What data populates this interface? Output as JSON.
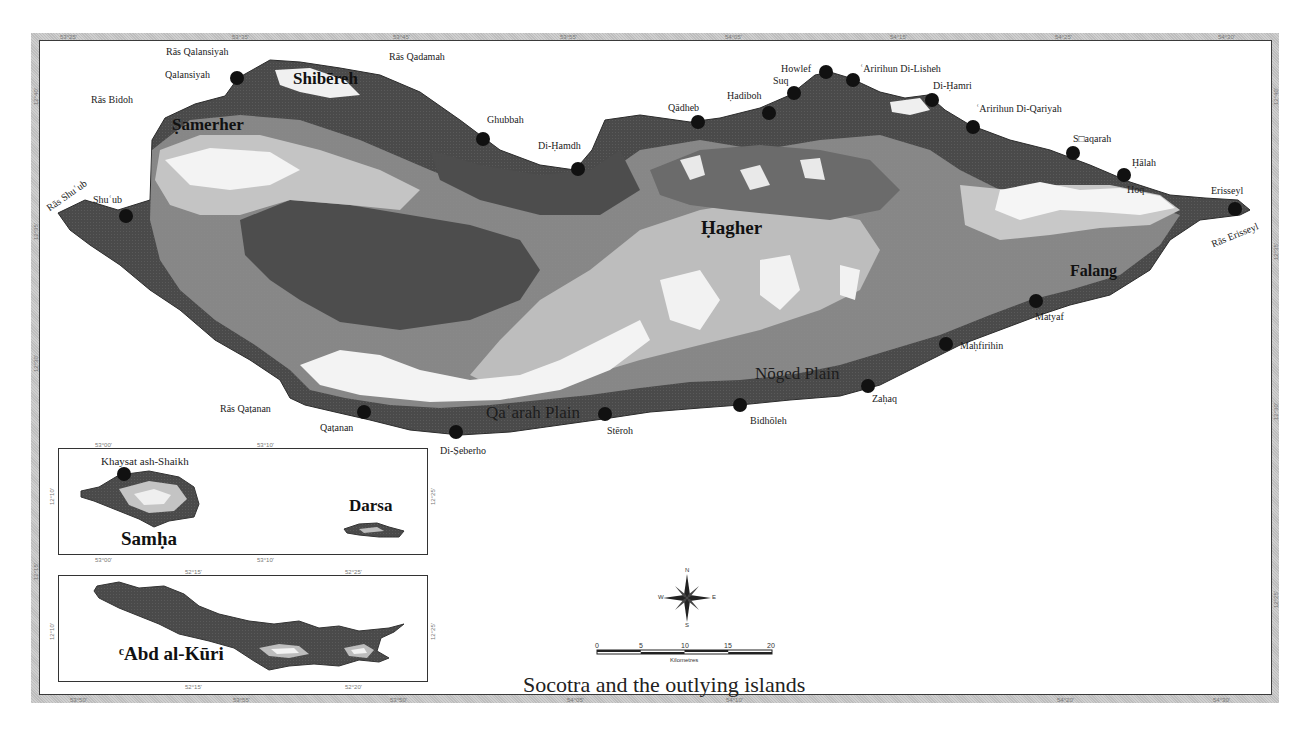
{
  "map": {
    "title": "Socotra and the outlying islands",
    "colors": {
      "sea": "#ffffff",
      "lowland": "#4a4a4a",
      "mid_elevation": "#8e8e8e",
      "high_elevation": "#bdbdbd",
      "summit": "#f2f2f2",
      "frame": "#c6c6c6",
      "settlement_dot": "#111111"
    },
    "frame_ticks": {
      "top": [
        "53°25'",
        "53°35'",
        "53°45'",
        "53°55'",
        "54°05'",
        "54°15'",
        "54°25'",
        "54°30'"
      ],
      "bottom": [
        "53°50'",
        "53°55'",
        "53°50'",
        "54°05'",
        "54°10'",
        "54°20'",
        "54°30'"
      ],
      "left": [
        "12°40'",
        "12°35'",
        "12°30'",
        "12°15'"
      ],
      "right": [
        "12°40'",
        "12°35'",
        "12°30'",
        "12°25'"
      ]
    },
    "regions": [
      {
        "name": "Shibēreh"
      },
      {
        "name": "Ṣamerher"
      },
      {
        "name": "Ḥagher"
      },
      {
        "name": "Falang"
      }
    ],
    "plains": [
      {
        "name": "Nōged Plain"
      },
      {
        "name": "Qaʿarah Plain"
      }
    ],
    "capes": [
      {
        "name": "Rās Qalansiyah"
      },
      {
        "name": "Rās Qadamah"
      },
      {
        "name": "Rās Bidoh"
      },
      {
        "name": "Rās Shuʿub"
      },
      {
        "name": "Rās Qaṭanan"
      },
      {
        "name": "Rās Erisseyl"
      }
    ],
    "settlements": [
      {
        "name": "Qalansiyah"
      },
      {
        "name": "Ghubbah"
      },
      {
        "name": "Di-Ḥamdh"
      },
      {
        "name": "Qādheb"
      },
      {
        "name": "Ḥadiboh"
      },
      {
        "name": "Suq"
      },
      {
        "name": "Howlef"
      },
      {
        "name": "ʿAririhun Di-Lisheh"
      },
      {
        "name": "Di-Ḥamri"
      },
      {
        "name": "ʿAririhun Di-Qariyah"
      },
      {
        "name": "S□aqarah"
      },
      {
        "name": "Ḥālah"
      },
      {
        "name": "Hoq"
      },
      {
        "name": "Erisseyl"
      },
      {
        "name": "Shuʿub"
      },
      {
        "name": "Matyaf"
      },
      {
        "name": "Maḥfirihin"
      },
      {
        "name": "Zaḥaq"
      },
      {
        "name": "Bidhōleh"
      },
      {
        "name": "Stēroh"
      },
      {
        "name": "Di-Ṣeberho"
      },
      {
        "name": "Qaṭanan"
      }
    ],
    "insets": [
      {
        "islands": [
          {
            "name": "Samḥa"
          },
          {
            "name": "Darsa"
          }
        ],
        "settlement": "Khaysat ash-Shaikh",
        "ticks_top": [
          "53°00'",
          "53°10'"
        ],
        "ticks_bottom": [
          "53°00'",
          "53°10'"
        ],
        "tick_left": "12°10'",
        "tick_right": "12°25'"
      },
      {
        "islands": [
          {
            "name": "ᶜAbd al-Kūri"
          }
        ],
        "ticks_top": [
          "52°15'",
          "52°25'"
        ],
        "ticks_bottom": [
          "52°15'",
          "52°20'"
        ],
        "tick_left": "12°10'",
        "tick_right": "12°25'"
      }
    ],
    "compass": {
      "n": "N",
      "s": "S",
      "e": "E",
      "w": "W"
    },
    "scale_bar": {
      "ticks": [
        "0",
        "5",
        "10",
        "15",
        "20"
      ],
      "unit": "Kilometres"
    }
  }
}
